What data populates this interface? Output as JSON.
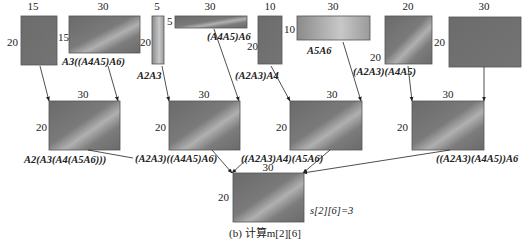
{
  "caption": "(b) 计算m[2][6]",
  "result_label": "s[2][6]=3",
  "colors": {
    "matrix_dark": "#6e6e6e",
    "matrix_light": "#b4b4b4",
    "edge": "#222222",
    "background": "#ffffff"
  },
  "top_row": [
    {
      "id": "t1",
      "width_label": "15",
      "height_label": "20",
      "label": ""
    },
    {
      "id": "t2",
      "width_label": "30",
      "height_label": "15",
      "label": "A3((A4A5)A6)"
    },
    {
      "id": "t3",
      "width_label": "5",
      "height_label": "20",
      "label": "A2A3"
    },
    {
      "id": "t4",
      "width_label": "30",
      "height_label": "5",
      "label": "(A4A5)A6"
    },
    {
      "id": "t5",
      "width_label": "10",
      "height_label": "20",
      "label": "(A2A3)A4"
    },
    {
      "id": "t6",
      "width_label": "30",
      "height_label": "10",
      "label": "A5A6"
    },
    {
      "id": "t7",
      "width_label": "20",
      "height_label": "20",
      "label": "(A2A3)(A4A5)"
    },
    {
      "id": "t8",
      "width_label": "30",
      "height_label": "20",
      "label": ""
    }
  ],
  "middle_row": [
    {
      "id": "m1",
      "width_label": "30",
      "height_label": "20",
      "label": "A2(A3(A4(A5A6)))"
    },
    {
      "id": "m2",
      "width_label": "30",
      "height_label": "20",
      "label": "(A2A3)((A4A5)A6)"
    },
    {
      "id": "m3",
      "width_label": "30",
      "height_label": "20",
      "label": "((A2A3)A4)(A5A6)"
    },
    {
      "id": "m4",
      "width_label": "30",
      "height_label": "20",
      "label": "((A2A3)(A4A5))A6"
    }
  ],
  "bottom": {
    "width_label": "30",
    "height_label": "20"
  }
}
